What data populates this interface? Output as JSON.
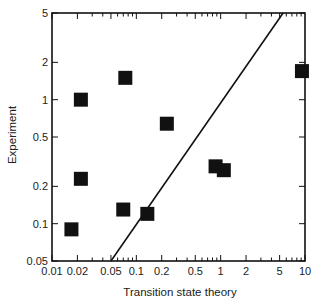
{
  "chart_data": {
    "type": "scatter",
    "title": "",
    "xlabel": "Transition state theory",
    "ylabel": "Experiment",
    "xscale": "log",
    "yscale": "log",
    "xlim": [
      0.01,
      10
    ],
    "ylim": [
      0.05,
      5
    ],
    "x_ticks": [
      0.01,
      0.02,
      0.05,
      0.1,
      0.2,
      0.5,
      1,
      2,
      5,
      10
    ],
    "x_tick_labels": [
      "0.01",
      "0.02",
      "0.05",
      "0.1",
      "0.2",
      "0.5",
      "1",
      "2",
      "5",
      "10"
    ],
    "y_ticks": [
      0.05,
      0.1,
      0.2,
      0.5,
      1,
      2,
      5
    ],
    "y_tick_labels": [
      "0.05",
      "0.1",
      "0.2",
      "0.5",
      "1",
      "2",
      "5"
    ],
    "grid": false,
    "legend": null,
    "series": [
      {
        "name": "data",
        "marker": "square",
        "color": "#111111",
        "points": [
          {
            "x": 0.017,
            "y": 0.09
          },
          {
            "x": 0.022,
            "y": 1.0
          },
          {
            "x": 0.022,
            "y": 0.23
          },
          {
            "x": 0.074,
            "y": 1.5
          },
          {
            "x": 0.23,
            "y": 0.64
          },
          {
            "x": 0.07,
            "y": 0.13
          },
          {
            "x": 0.135,
            "y": 0.12
          },
          {
            "x": 0.87,
            "y": 0.29
          },
          {
            "x": 1.09,
            "y": 0.27
          },
          {
            "x": 9.2,
            "y": 1.7
          }
        ]
      }
    ],
    "reference_line": {
      "name": "y = x",
      "from": [
        0.05,
        0.05
      ],
      "to": [
        5.5,
        5
      ],
      "color": "#111111"
    }
  }
}
